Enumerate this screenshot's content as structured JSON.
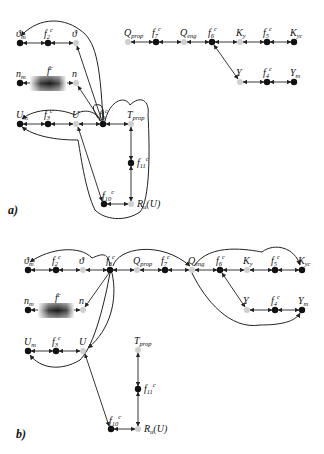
{
  "colors": {
    "black_node": "#111111",
    "grey_node": "#cfcfcf",
    "edge": "#222222"
  },
  "panels": [
    {
      "label": "a)",
      "nodes": [
        {
          "id": "theta_m",
          "label": "ϑ",
          "sub": "m",
          "type": "black",
          "x": 20,
          "y": 43
        },
        {
          "id": "f2",
          "label": "f",
          "sub": "2",
          "sup": "c",
          "type": "black",
          "x": 48,
          "y": 43
        },
        {
          "id": "theta",
          "label": "ϑ",
          "type": "grey",
          "x": 76,
          "y": 43
        },
        {
          "id": "n_m",
          "label": "n",
          "sub": "m",
          "type": "black",
          "x": 20,
          "y": 83
        },
        {
          "id": "f1",
          "label": "f",
          "sub": "1",
          "sup": "c",
          "type": "box",
          "x": 48,
          "y": 83
        },
        {
          "id": "n",
          "label": "n",
          "type": "grey",
          "x": 76,
          "y": 83
        },
        {
          "id": "U_m",
          "label": "U",
          "sub": "m",
          "type": "black",
          "x": 20,
          "y": 124
        },
        {
          "id": "f3",
          "label": "f",
          "sub": "3",
          "sup": "c",
          "type": "black",
          "x": 48,
          "y": 124
        },
        {
          "id": "U",
          "label": "U",
          "type": "grey",
          "x": 76,
          "y": 124
        },
        {
          "id": "f9",
          "label": "f",
          "sub": "9",
          "sup": "c",
          "type": "black",
          "x": 103,
          "y": 124
        },
        {
          "id": "T_prop",
          "label": "T",
          "sub": "prop",
          "type": "grey",
          "x": 131,
          "y": 124
        },
        {
          "id": "f11",
          "label": "f",
          "sub": "11",
          "sup": "c",
          "type": "black",
          "x": 131,
          "y": 163
        },
        {
          "id": "f10",
          "label": "f",
          "sub": "10",
          "sup": "c",
          "type": "black",
          "x": 104,
          "y": 204
        },
        {
          "id": "R_u",
          "label": "R",
          "sub": "u",
          "suffix": "(U)",
          "type": "grey",
          "x": 131,
          "y": 204
        },
        {
          "id": "Q_prop",
          "label": "Q",
          "sub": "prop",
          "type": "grey",
          "x": 128,
          "y": 42
        },
        {
          "id": "f7",
          "label": "f",
          "sub": "7",
          "sup": "c",
          "type": "black",
          "x": 156,
          "y": 42
        },
        {
          "id": "Q_eng",
          "label": "Q",
          "sub": "eng",
          "type": "grey",
          "x": 184,
          "y": 42
        },
        {
          "id": "f6",
          "label": "f",
          "sub": "6",
          "sup": "c",
          "type": "black",
          "x": 212,
          "y": 42
        },
        {
          "id": "K_y",
          "label": "K",
          "sub": "y",
          "type": "grey",
          "x": 240,
          "y": 42
        },
        {
          "id": "f5",
          "label": "f",
          "sub": "5",
          "sup": "c",
          "type": "black",
          "x": 267,
          "y": 42
        },
        {
          "id": "K_yc",
          "label": "K",
          "sub": "yc",
          "type": "black",
          "x": 294,
          "y": 42
        },
        {
          "id": "Y",
          "label": "Y",
          "type": "grey",
          "x": 240,
          "y": 82
        },
        {
          "id": "f4",
          "label": "f",
          "sub": "4",
          "sup": "c",
          "type": "black",
          "x": 267,
          "y": 82
        },
        {
          "id": "Y_m",
          "label": "Y",
          "sub": "m",
          "type": "black",
          "x": 294,
          "y": 82
        }
      ]
    },
    {
      "label": "b)",
      "nodes": [
        {
          "id": "theta_m",
          "label": "ϑ",
          "sub": "m",
          "type": "black",
          "x": 28,
          "y": 270
        },
        {
          "id": "f2",
          "label": "f",
          "sub": "2",
          "sup": "c",
          "type": "black",
          "x": 56,
          "y": 270
        },
        {
          "id": "theta",
          "label": "ϑ",
          "type": "grey",
          "x": 83,
          "y": 270
        },
        {
          "id": "f8",
          "label": "f",
          "sub": "8",
          "sup": "c",
          "type": "black",
          "x": 110,
          "y": 270
        },
        {
          "id": "Q_prop",
          "label": "Q",
          "sub": "prop",
          "type": "grey",
          "x": 137,
          "y": 270
        },
        {
          "id": "f7",
          "label": "f",
          "sub": "7",
          "sup": "c",
          "type": "black",
          "x": 165,
          "y": 270
        },
        {
          "id": "Q_eng",
          "label": "Q",
          "sub": "eng",
          "type": "grey",
          "x": 192,
          "y": 270
        },
        {
          "id": "f6",
          "label": "f",
          "sub": "6",
          "sup": "c",
          "type": "black",
          "x": 220,
          "y": 270
        },
        {
          "id": "K_y",
          "label": "K",
          "sub": "y",
          "type": "grey",
          "x": 247,
          "y": 270
        },
        {
          "id": "f5",
          "label": "f",
          "sub": "5",
          "sup": "c",
          "type": "black",
          "x": 275,
          "y": 270
        },
        {
          "id": "K_yc",
          "label": "K",
          "sub": "yc",
          "type": "black",
          "x": 302,
          "y": 270
        },
        {
          "id": "Y",
          "label": "Y",
          "type": "grey",
          "x": 247,
          "y": 310
        },
        {
          "id": "f4",
          "label": "f",
          "sub": "4",
          "sup": "c",
          "type": "black",
          "x": 275,
          "y": 310
        },
        {
          "id": "Y_m",
          "label": "Y",
          "sub": "m",
          "type": "black",
          "x": 302,
          "y": 310
        },
        {
          "id": "n_m",
          "label": "n",
          "sub": "m",
          "type": "black",
          "x": 28,
          "y": 310
        },
        {
          "id": "f1",
          "label": "f",
          "sub": "1",
          "sup": "c",
          "type": "box",
          "x": 56,
          "y": 310
        },
        {
          "id": "n",
          "label": "n",
          "type": "grey",
          "x": 83,
          "y": 310
        },
        {
          "id": "U_m",
          "label": "U",
          "sub": "m",
          "type": "black",
          "x": 28,
          "y": 351
        },
        {
          "id": "f3",
          "label": "f",
          "sub": "3",
          "sup": "c",
          "type": "black",
          "x": 56,
          "y": 351
        },
        {
          "id": "U",
          "label": "U",
          "type": "grey",
          "x": 83,
          "y": 351
        },
        {
          "id": "T_prop",
          "label": "T",
          "sub": "prop",
          "type": "grey",
          "x": 138,
          "y": 350
        },
        {
          "id": "f11",
          "label": "f",
          "sub": "11",
          "sup": "c",
          "type": "black",
          "x": 138,
          "y": 389
        },
        {
          "id": "f10",
          "label": "f",
          "sub": "10",
          "sup": "c",
          "type": "black",
          "x": 111,
          "y": 429
        },
        {
          "id": "R_u",
          "label": "R",
          "sub": "u",
          "suffix": "(U)",
          "type": "grey",
          "x": 138,
          "y": 429
        }
      ]
    }
  ]
}
